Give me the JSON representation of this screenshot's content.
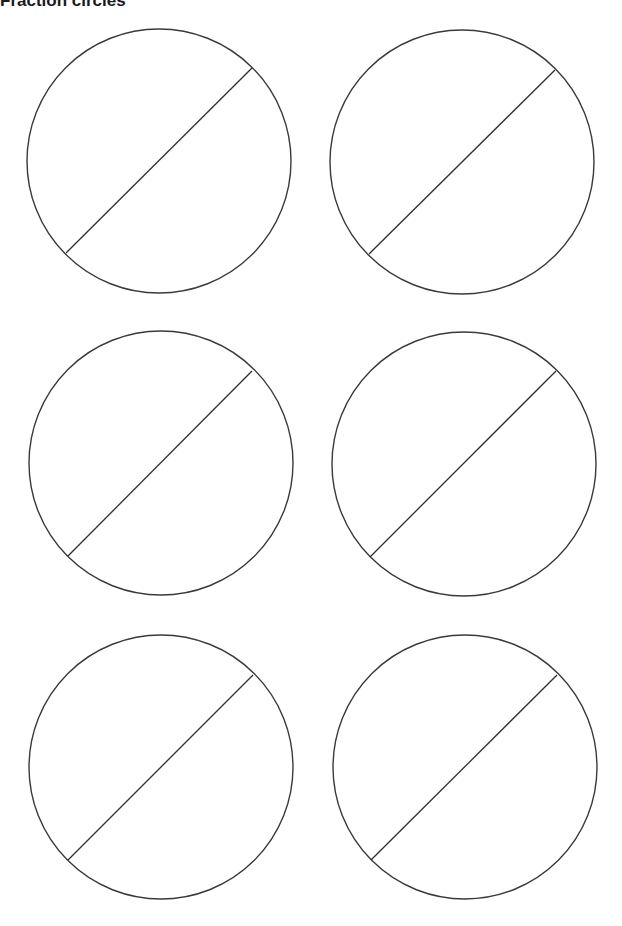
{
  "page": {
    "title": "Fraction circles"
  },
  "colors": {
    "background": "#ffffff",
    "stroke": "#3a3a3a"
  },
  "circles": [
    {
      "id": "top-left",
      "cx": 159,
      "cy": 161,
      "r": 132,
      "divider": {
        "x1": 252,
        "y1": 68,
        "x2": 66,
        "y2": 253
      },
      "parts": 2
    },
    {
      "id": "top-right",
      "cx": 462,
      "cy": 162,
      "r": 132,
      "divider": {
        "x1": 555,
        "y1": 70,
        "x2": 369,
        "y2": 254
      },
      "parts": 2
    },
    {
      "id": "middle-left",
      "cx": 161,
      "cy": 463,
      "r": 132,
      "divider": {
        "x1": 252,
        "y1": 371,
        "x2": 68,
        "y2": 556
      },
      "parts": 2
    },
    {
      "id": "middle-right",
      "cx": 464,
      "cy": 464,
      "r": 132,
      "divider": {
        "x1": 556,
        "y1": 371,
        "x2": 370,
        "y2": 557
      },
      "parts": 2
    },
    {
      "id": "bottom-left",
      "cx": 161,
      "cy": 767,
      "r": 132,
      "divider": {
        "x1": 253,
        "y1": 675,
        "x2": 68,
        "y2": 860
      },
      "parts": 2
    },
    {
      "id": "bottom-right",
      "cx": 465,
      "cy": 767,
      "r": 132,
      "divider": {
        "x1": 557,
        "y1": 675,
        "x2": 371,
        "y2": 860
      },
      "parts": 2
    }
  ]
}
